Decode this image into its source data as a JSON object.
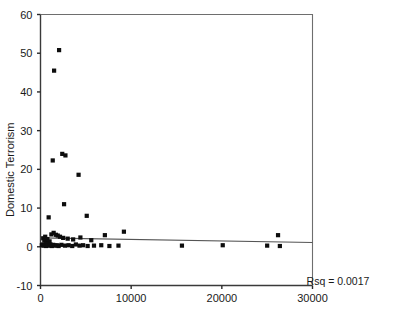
{
  "chart_data": {
    "type": "scatter",
    "title": "",
    "xlabel": "",
    "ylabel": "Domestic Terrorism",
    "xlim": [
      0,
      30000
    ],
    "ylim": [
      -10,
      60
    ],
    "xticks": [
      0,
      10000,
      20000,
      30000
    ],
    "xtick_labels": [
      "0",
      "10000",
      "20000",
      "30000"
    ],
    "yticks": [
      -10,
      0,
      10,
      20,
      30,
      40,
      50,
      60
    ],
    "ytick_labels": [
      "-10",
      "0",
      "10",
      "20",
      "30",
      "40",
      "50",
      "60"
    ],
    "grid": false,
    "legend": null,
    "marker_style": "filled-square",
    "marker_color": "#0d0d0d",
    "points": [
      [
        2050,
        50.8
      ],
      [
        1500,
        45.5
      ],
      [
        1350,
        22.3
      ],
      [
        2400,
        24.0
      ],
      [
        2750,
        23.6
      ],
      [
        4200,
        18.6
      ],
      [
        900,
        7.6
      ],
      [
        2600,
        11.0
      ],
      [
        5100,
        8.0
      ],
      [
        1200,
        3.2
      ],
      [
        1450,
        3.6
      ],
      [
        1700,
        3.1
      ],
      [
        1900,
        2.9
      ],
      [
        2150,
        2.6
      ],
      [
        2500,
        2.3
      ],
      [
        3000,
        2.1
      ],
      [
        3600,
        1.9
      ],
      [
        4400,
        2.4
      ],
      [
        5600,
        1.7
      ],
      [
        7100,
        3.0
      ],
      [
        9200,
        3.9
      ],
      [
        300,
        2.2
      ],
      [
        420,
        1.6
      ],
      [
        520,
        2.6
      ],
      [
        640,
        1.2
      ],
      [
        760,
        2.0
      ],
      [
        880,
        0.8
      ],
      [
        1000,
        1.4
      ],
      [
        150,
        0.4
      ],
      [
        240,
        0.6
      ],
      [
        330,
        0.3
      ],
      [
        470,
        0.5
      ],
      [
        600,
        0.2
      ],
      [
        700,
        0.7
      ],
      [
        820,
        0.4
      ],
      [
        950,
        0.3
      ],
      [
        1100,
        0.6
      ],
      [
        1250,
        0.2
      ],
      [
        1400,
        0.5
      ],
      [
        1600,
        0.3
      ],
      [
        1800,
        0.4
      ],
      [
        2000,
        0.2
      ],
      [
        2300,
        0.5
      ],
      [
        2700,
        0.3
      ],
      [
        3100,
        0.4
      ],
      [
        3500,
        0.2
      ],
      [
        3900,
        0.6
      ],
      [
        4300,
        0.3
      ],
      [
        4700,
        0.4
      ],
      [
        5200,
        0.2
      ],
      [
        5900,
        0.3
      ],
      [
        6700,
        0.4
      ],
      [
        7600,
        0.2
      ],
      [
        8600,
        0.3
      ],
      [
        15600,
        0.3
      ],
      [
        20100,
        0.4
      ],
      [
        25000,
        0.3
      ],
      [
        26200,
        3.0
      ],
      [
        26400,
        0.2
      ]
    ],
    "fitline": {
      "x_start": 0,
      "x_end": 30000,
      "y_start": 2.3,
      "y_end": 1.1
    },
    "annotations": [
      {
        "name": "rsq",
        "text": "Rsq = 0.0017"
      }
    ]
  },
  "axes": {
    "y_axis_title": "Domestic Terrorism"
  },
  "footer": {
    "cropped_caption": ""
  }
}
